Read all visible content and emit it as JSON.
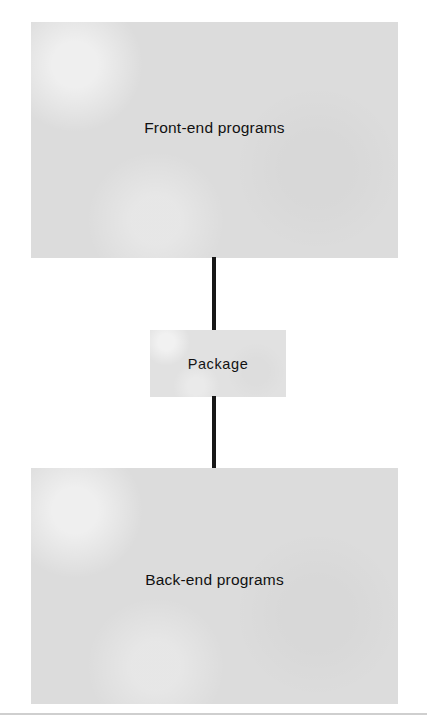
{
  "diagram": {
    "type": "flow-diagram",
    "title": "",
    "orientation": "vertical",
    "background_color": "#ffffff",
    "node_fill_color": "#dcdcdc",
    "package_fill_color": "#e1e1e1",
    "connector_color": "#171717",
    "rule_color": "#cfcfcf",
    "nodes": [
      {
        "id": "frontend",
        "label": "Front-end programs",
        "shape": "rectangle",
        "fill": "#dcdcdc"
      },
      {
        "id": "package",
        "label": "Package",
        "shape": "rectangle",
        "fill": "#e1e1e1"
      },
      {
        "id": "backend",
        "label": "Back-end programs",
        "shape": "rectangle",
        "fill": "#dcdcdc"
      }
    ],
    "edges": [
      {
        "id": "frontend-to-package",
        "from": "frontend",
        "to": "package",
        "style": "solid-line",
        "arrowhead": "none"
      },
      {
        "id": "package-to-backend",
        "from": "package",
        "to": "backend",
        "style": "solid-line",
        "arrowhead": "none"
      }
    ],
    "footer_rule": true
  }
}
